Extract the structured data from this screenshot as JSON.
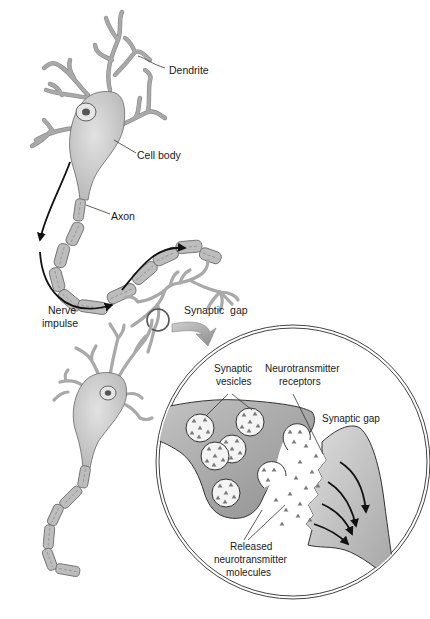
{
  "diagram": {
    "labels": {
      "dendrite": "Dendrite",
      "cell_body": "Cell body",
      "axon": "Axon",
      "nerve_impulse_line1": "Nerve",
      "nerve_impulse_line2": "impulse",
      "synaptic_gap_upper": "Synaptic  gap",
      "synaptic_vesicles_line1": "Synaptic",
      "synaptic_vesicles_line2": "vesicles",
      "nt_receptors_line1": "Neurotransmitter",
      "nt_receptors_line2": "receptors",
      "synaptic_gap_inset": "Synaptic gap",
      "released_line1": "Released",
      "released_line2": "neurotransmitter",
      "released_line3": "molecules"
    },
    "colors": {
      "background": "#ffffff",
      "cell_fill": "#d0d0d0",
      "myelin_fill": "#bdbdbd",
      "terminal_fill": "#a8a8a8",
      "outline": "#333333",
      "text": "#1a1a1a"
    }
  }
}
